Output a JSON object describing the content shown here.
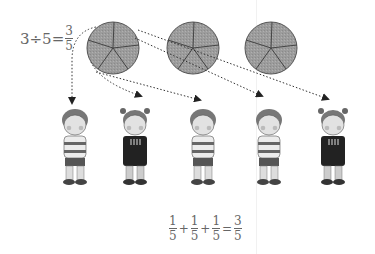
{
  "equation_top": {
    "lhs": "3÷5=",
    "numerator": "3",
    "denominator": "5"
  },
  "equation_bottom": {
    "terms": [
      {
        "numerator": "1",
        "denominator": "5"
      },
      {
        "numerator": "1",
        "denominator": "5"
      },
      {
        "numerator": "1",
        "denominator": "5"
      }
    ],
    "plus": "+",
    "equals": "=",
    "result": {
      "numerator": "3",
      "denominator": "5"
    }
  },
  "pies": [
    {
      "label": "pie-1",
      "slices": 5
    },
    {
      "label": "pie-2",
      "slices": 5
    },
    {
      "label": "pie-3",
      "slices": 5
    }
  ],
  "children": [
    {
      "type": "boy"
    },
    {
      "type": "girl"
    },
    {
      "type": "boy"
    },
    {
      "type": "boy"
    },
    {
      "type": "girl"
    }
  ],
  "colors": {
    "pie_fill": "#9a9a9a",
    "pie_stroke": "#555555",
    "arrow": "#333333",
    "text": "#666666"
  }
}
